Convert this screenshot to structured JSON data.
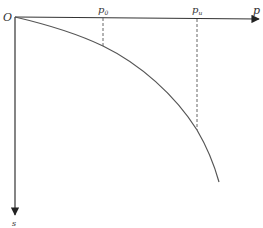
{
  "diagram": {
    "type": "load-settlement curve",
    "origin_label": "O",
    "x_axis": {
      "label": "p"
    },
    "y_axis": {
      "label": "s"
    },
    "markers": [
      {
        "base": "p",
        "subscript": "0"
      },
      {
        "base": "p",
        "subscript": "u"
      }
    ],
    "colors": {
      "axis": "#333333",
      "curve": "#555555",
      "dashed": "#666666",
      "background": "#ffffff"
    }
  }
}
